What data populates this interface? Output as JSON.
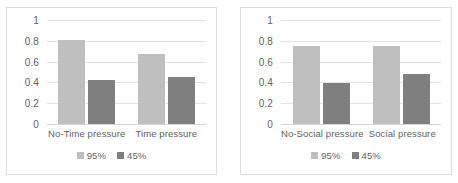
{
  "colors": {
    "series_95": "#bfbfbf",
    "series_45": "#7f7f7f",
    "gridline": "#e3e3e3",
    "frame_border": "#dcdcdc",
    "text": "#5f5f5f",
    "background": "#ffffff"
  },
  "chart_data": [
    {
      "type": "bar",
      "title": "",
      "xlabel": "",
      "ylabel": "",
      "categories": [
        "No-Time pressure",
        "Time pressure"
      ],
      "series": [
        {
          "name": "95%",
          "values": [
            0.81,
            0.67
          ],
          "color": "#bfbfbf"
        },
        {
          "name": "45%",
          "values": [
            0.42,
            0.45
          ],
          "color": "#7f7f7f"
        }
      ],
      "ylim": [
        0,
        1
      ],
      "yticks": [
        1,
        0.8,
        0.6,
        0.4,
        0.2,
        0
      ],
      "ytick_labels": [
        "1",
        "0.8",
        "0.6",
        "0.4",
        "0.2",
        "0"
      ],
      "grid": true,
      "legend_position": "bottom",
      "legend_entries": [
        "95%",
        "45%"
      ]
    },
    {
      "type": "bar",
      "title": "",
      "xlabel": "",
      "ylabel": "",
      "categories": [
        "No-Social pressure",
        "Social pressure"
      ],
      "series": [
        {
          "name": "95%",
          "values": [
            0.75,
            0.75
          ],
          "color": "#bfbfbf"
        },
        {
          "name": "45%",
          "values": [
            0.39,
            0.48
          ],
          "color": "#7f7f7f"
        }
      ],
      "ylim": [
        0,
        1
      ],
      "yticks": [
        1,
        0.8,
        0.6,
        0.4,
        0.2,
        0
      ],
      "ytick_labels": [
        "1",
        "0.8",
        "0.6",
        "0.4",
        "0.2",
        "0"
      ],
      "grid": true,
      "legend_position": "bottom",
      "legend_entries": [
        "95%",
        "45%"
      ]
    }
  ]
}
